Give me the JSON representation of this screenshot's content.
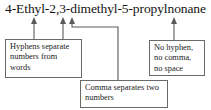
{
  "title": {
    "text": "4-Ethyl-2,3-dimethyl-5-propylnonane"
  },
  "annotations": {
    "hyphens": {
      "text": "Hyphens separate numbers from words"
    },
    "comma": {
      "text": "Comma separates two numbers"
    },
    "nospace": {
      "text": "No hyphen, no comma, no space"
    }
  },
  "colors": {
    "text": "#1a1a1a",
    "box_border": "#6a6a6a",
    "connector": "#5a5a5a",
    "background": "#ffffff"
  }
}
